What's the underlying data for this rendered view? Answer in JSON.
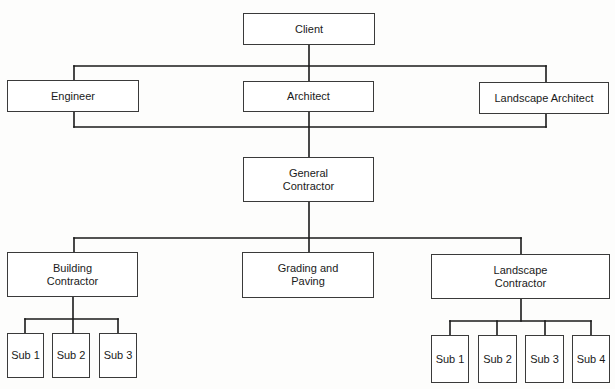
{
  "diagram": {
    "type": "org-chart",
    "line_color": "#1a1a1a",
    "nodes": [
      {
        "id": "client",
        "label": "Client",
        "x": 243,
        "y": 13,
        "w": 132,
        "h": 32
      },
      {
        "id": "engineer",
        "label": "Engineer",
        "x": 7,
        "y": 80,
        "w": 132,
        "h": 32
      },
      {
        "id": "architect",
        "label": "Architect",
        "x": 243,
        "y": 81,
        "w": 131,
        "h": 31
      },
      {
        "id": "landscape-architect",
        "label": "Landscape Architect",
        "x": 479,
        "y": 82,
        "w": 130,
        "h": 32
      },
      {
        "id": "general-contractor",
        "label": "General\nContractor",
        "x": 243,
        "y": 157,
        "w": 131,
        "h": 45
      },
      {
        "id": "building-contractor",
        "label": "Building\nContractor",
        "x": 7,
        "y": 252,
        "w": 131,
        "h": 45
      },
      {
        "id": "grading-and-paving",
        "label": "Grading and\nPaving",
        "x": 242,
        "y": 252,
        "w": 132,
        "h": 46
      },
      {
        "id": "landscape-contractor",
        "label": "Landscape\nContractor",
        "x": 431,
        "y": 254,
        "w": 179,
        "h": 45
      },
      {
        "id": "bc-sub-1",
        "label": "Sub 1",
        "x": 7,
        "y": 333,
        "w": 37,
        "h": 45
      },
      {
        "id": "bc-sub-2",
        "label": "Sub 2",
        "x": 52,
        "y": 333,
        "w": 38,
        "h": 45
      },
      {
        "id": "bc-sub-3",
        "label": "Sub 3",
        "x": 99,
        "y": 333,
        "w": 38,
        "h": 45
      },
      {
        "id": "lc-sub-1",
        "label": "Sub 1",
        "x": 431,
        "y": 335,
        "w": 38,
        "h": 48
      },
      {
        "id": "lc-sub-2",
        "label": "Sub 2",
        "x": 478,
        "y": 335,
        "w": 39,
        "h": 48
      },
      {
        "id": "lc-sub-3",
        "label": "Sub 3",
        "x": 525,
        "y": 335,
        "w": 39,
        "h": 48
      },
      {
        "id": "lc-sub-4",
        "label": "Sub 4",
        "x": 572,
        "y": 335,
        "w": 38,
        "h": 48
      }
    ],
    "edges": [
      {
        "from": "client",
        "to": "design-team-top-bar"
      },
      {
        "from": "design-team-top-bar",
        "to": "engineer"
      },
      {
        "from": "design-team-top-bar",
        "to": "architect"
      },
      {
        "from": "design-team-top-bar",
        "to": "landscape-architect"
      },
      {
        "from": "design-team-bottom-bar",
        "to": "general-contractor"
      },
      {
        "from": "general-contractor",
        "to": "building-contractor"
      },
      {
        "from": "general-contractor",
        "to": "grading-and-paving"
      },
      {
        "from": "general-contractor",
        "to": "landscape-contractor"
      },
      {
        "from": "building-contractor",
        "to": "bc-sub-1"
      },
      {
        "from": "building-contractor",
        "to": "bc-sub-2"
      },
      {
        "from": "building-contractor",
        "to": "bc-sub-3"
      },
      {
        "from": "landscape-contractor",
        "to": "lc-sub-1"
      },
      {
        "from": "landscape-contractor",
        "to": "lc-sub-2"
      },
      {
        "from": "landscape-contractor",
        "to": "lc-sub-3"
      },
      {
        "from": "landscape-contractor",
        "to": "lc-sub-4"
      }
    ],
    "connector_lines": [
      [
        309,
        45,
        309,
        81
      ],
      [
        74,
        66,
        546,
        66
      ],
      [
        74,
        66,
        74,
        80
      ],
      [
        546,
        66,
        546,
        82
      ],
      [
        74,
        112,
        74,
        127
      ],
      [
        546,
        114,
        546,
        127
      ],
      [
        74,
        127,
        546,
        127
      ],
      [
        309,
        112,
        309,
        157
      ],
      [
        309,
        202,
        309,
        252
      ],
      [
        74,
        238,
        521,
        238
      ],
      [
        74,
        238,
        74,
        252
      ],
      [
        521,
        238,
        521,
        254
      ],
      [
        73,
        297,
        73,
        333
      ],
      [
        25,
        319,
        118,
        319
      ],
      [
        25,
        319,
        25,
        333
      ],
      [
        118,
        319,
        118,
        333
      ],
      [
        521,
        299,
        521,
        321
      ],
      [
        450,
        321,
        591,
        321
      ],
      [
        450,
        321,
        450,
        335
      ],
      [
        497,
        321,
        497,
        335
      ],
      [
        545,
        321,
        545,
        335
      ],
      [
        591,
        321,
        591,
        335
      ]
    ]
  }
}
